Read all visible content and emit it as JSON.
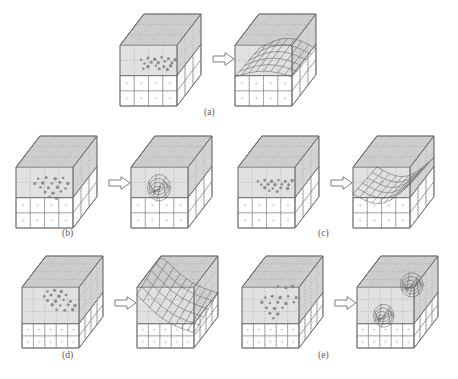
{
  "figure": {
    "type": "multi-panel-diagram",
    "background_color": "#ffffff",
    "ink_color": "#6a6a6e",
    "shade_color": "#c9c9cb",
    "dot_color": "#7e7e82",
    "dashed_color": "#a8a8ac",
    "top_bleed_fragments": [
      {
        "text": "·  ·",
        "left": 188,
        "opacity": 0.5
      },
      {
        "text": "·",
        "left": 300,
        "opacity": 0.5
      }
    ],
    "panels": [
      {
        "id": "a",
        "label": "(a)",
        "label_x": 204,
        "label_y": 107,
        "x": 120,
        "y": 14,
        "arrow": {
          "x": 93,
          "y": 38,
          "label": "transforms-to"
        },
        "left": {
          "name": "input-voxel-grid-a",
          "x": 0,
          "y": 0,
          "w": 92,
          "h": 92,
          "cols": 4,
          "rows": 4,
          "depth": 3,
          "shade_rows": 2,
          "dots": [
            [
              0.18,
              0.47
            ],
            [
              0.3,
              0.44
            ],
            [
              0.42,
              0.46
            ],
            [
              0.54,
              0.43
            ],
            [
              0.66,
              0.45
            ],
            [
              0.78,
              0.47
            ],
            [
              0.24,
              0.53
            ],
            [
              0.36,
              0.51
            ],
            [
              0.48,
              0.52
            ],
            [
              0.6,
              0.5
            ],
            [
              0.72,
              0.52
            ],
            [
              0.3,
              0.58
            ],
            [
              0.44,
              0.57
            ],
            [
              0.58,
              0.58
            ],
            [
              0.7,
              0.57
            ],
            [
              0.22,
              0.62
            ],
            [
              0.5,
              0.62
            ],
            [
              0.64,
              0.63
            ]
          ],
          "surface": null
        },
        "right": {
          "name": "reconstructed-surface-a",
          "x": 115,
          "y": 0,
          "w": 92,
          "h": 92,
          "cols": 4,
          "rows": 4,
          "depth": 3,
          "shade_rows": 2,
          "dots": [],
          "surface": "broad-ridge"
        }
      },
      {
        "id": "b",
        "label": "(b)",
        "label_x": 62,
        "label_y": 228,
        "x": 16,
        "y": 136,
        "arrow": {
          "x": 93,
          "y": 40,
          "label": "transforms-to"
        },
        "left": {
          "name": "input-voxel-grid-b",
          "x": 0,
          "y": 0,
          "w": 92,
          "h": 92,
          "cols": 4,
          "rows": 4,
          "depth": 3,
          "shade_rows": 2,
          "dots": [
            [
              0.2,
              0.42
            ],
            [
              0.34,
              0.4
            ],
            [
              0.5,
              0.42
            ],
            [
              0.64,
              0.41
            ],
            [
              0.14,
              0.5
            ],
            [
              0.28,
              0.49
            ],
            [
              0.44,
              0.5
            ],
            [
              0.58,
              0.48
            ],
            [
              0.72,
              0.5
            ],
            [
              0.24,
              0.56
            ],
            [
              0.38,
              0.57
            ],
            [
              0.54,
              0.56
            ],
            [
              0.68,
              0.58
            ],
            [
              0.32,
              0.64
            ],
            [
              0.46,
              0.66
            ],
            [
              0.6,
              0.63
            ],
            [
              0.4,
              0.72
            ],
            [
              0.52,
              0.74
            ]
          ],
          "surface": null
        },
        "right": {
          "name": "reconstructed-surface-b",
          "x": 115,
          "y": 0,
          "w": 92,
          "h": 92,
          "cols": 4,
          "rows": 4,
          "depth": 3,
          "shade_rows": 2,
          "dots": [],
          "surface": "single-blob-left"
        }
      },
      {
        "id": "c",
        "label": "(c)",
        "label_x": 318,
        "label_y": 228,
        "x": 238,
        "y": 136,
        "arrow": {
          "x": 93,
          "y": 40,
          "label": "transforms-to"
        },
        "left": {
          "name": "input-voxel-grid-c",
          "x": 0,
          "y": 0,
          "w": 92,
          "h": 92,
          "cols": 4,
          "rows": 4,
          "depth": 3,
          "shade_rows": 2,
          "dots": [
            [
              0.16,
              0.46
            ],
            [
              0.28,
              0.44
            ],
            [
              0.4,
              0.46
            ],
            [
              0.52,
              0.44
            ],
            [
              0.64,
              0.46
            ],
            [
              0.76,
              0.45
            ],
            [
              0.22,
              0.52
            ],
            [
              0.34,
              0.51
            ],
            [
              0.46,
              0.52
            ],
            [
              0.58,
              0.51
            ],
            [
              0.7,
              0.52
            ],
            [
              0.28,
              0.57
            ],
            [
              0.42,
              0.58
            ],
            [
              0.56,
              0.57
            ],
            [
              0.68,
              0.58
            ],
            [
              0.36,
              0.62
            ],
            [
              0.5,
              0.63
            ]
          ],
          "surface": null
        },
        "right": {
          "name": "reconstructed-surface-c",
          "x": 115,
          "y": 0,
          "w": 92,
          "h": 92,
          "cols": 4,
          "rows": 4,
          "depth": 3,
          "shade_rows": 2,
          "dots": [],
          "surface": "folded-sheet"
        }
      },
      {
        "id": "d",
        "label": "(d)",
        "label_x": 62,
        "label_y": 350,
        "x": 22,
        "y": 256,
        "arrow": {
          "x": 93,
          "y": 40,
          "label": "transforms-to"
        },
        "left": {
          "name": "input-voxel-grid-d",
          "x": 0,
          "y": 0,
          "w": 92,
          "h": 92,
          "cols": 5,
          "rows": 5,
          "depth": 4,
          "shade_rows": 3,
          "dots": [
            [
              0.26,
              0.3
            ],
            [
              0.38,
              0.28
            ],
            [
              0.5,
              0.3
            ],
            [
              0.2,
              0.38
            ],
            [
              0.32,
              0.36
            ],
            [
              0.46,
              0.38
            ],
            [
              0.58,
              0.36
            ],
            [
              0.26,
              0.45
            ],
            [
              0.4,
              0.46
            ],
            [
              0.54,
              0.44
            ],
            [
              0.66,
              0.46
            ],
            [
              0.34,
              0.52
            ],
            [
              0.48,
              0.53
            ],
            [
              0.62,
              0.52
            ],
            [
              0.74,
              0.53
            ],
            [
              0.42,
              0.6
            ],
            [
              0.56,
              0.61
            ],
            [
              0.7,
              0.6
            ]
          ],
          "surface": null
        },
        "right": {
          "name": "reconstructed-surface-d",
          "x": 115,
          "y": 0,
          "w": 92,
          "h": 92,
          "cols": 5,
          "rows": 5,
          "depth": 4,
          "shade_rows": 3,
          "dots": [],
          "surface": "diagonal-sheet"
        }
      },
      {
        "id": "e",
        "label": "(e)",
        "label_x": 318,
        "label_y": 350,
        "x": 242,
        "y": 256,
        "arrow": {
          "x": 93,
          "y": 40,
          "label": "transforms-to"
        },
        "left": {
          "name": "input-voxel-grid-e",
          "x": 0,
          "y": 0,
          "w": 92,
          "h": 92,
          "cols": 5,
          "rows": 5,
          "depth": 4,
          "shade_rows": 3,
          "dots": [
            [
              0.44,
              0.22
            ],
            [
              0.58,
              0.24
            ],
            [
              0.7,
              0.22
            ],
            [
              0.22,
              0.4
            ],
            [
              0.34,
              0.38
            ],
            [
              0.48,
              0.4
            ],
            [
              0.62,
              0.38
            ],
            [
              0.76,
              0.4
            ],
            [
              0.16,
              0.48
            ],
            [
              0.3,
              0.49
            ],
            [
              0.44,
              0.48
            ],
            [
              0.58,
              0.5
            ],
            [
              0.72,
              0.48
            ],
            [
              0.24,
              0.57
            ],
            [
              0.38,
              0.58
            ],
            [
              0.52,
              0.57
            ],
            [
              0.3,
              0.66
            ],
            [
              0.44,
              0.67
            ],
            [
              0.36,
              0.74
            ]
          ],
          "surface": null
        },
        "right": {
          "name": "reconstructed-surface-e",
          "x": 115,
          "y": 0,
          "w": 92,
          "h": 92,
          "cols": 5,
          "rows": 5,
          "depth": 4,
          "shade_rows": 3,
          "dots": [],
          "surface": "two-blobs"
        }
      }
    ]
  }
}
